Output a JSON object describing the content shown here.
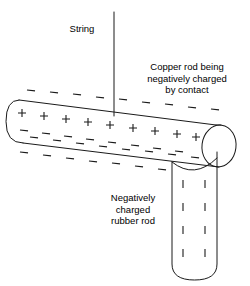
{
  "figure": {
    "background_color": "#ffffff",
    "stroke_color": "#1a1a1a",
    "width": 250,
    "height": 286
  },
  "labels": {
    "string": "String",
    "copper": "Copper rod being\nnegatively charged\nby contact",
    "rubber": "Negatively\ncharged\nrubber rod"
  },
  "elements": {
    "string_line": {
      "name": "string",
      "x": 114,
      "y_top": 12,
      "y_bottom": 116
    },
    "copper_rod": {
      "name": "copper-rod",
      "orientation": "horizontal-tilted",
      "left_x": 10,
      "right_x": 238,
      "tilt": "descending-to-right",
      "interior_charge": "+",
      "exterior_charge": "-",
      "interior_charge_count": 10,
      "exterior_charge_rows": 2
    },
    "rubber_rod": {
      "name": "rubber-rod",
      "orientation": "vertical",
      "left_x": 172,
      "right_x": 217,
      "top_y": 158,
      "bottom_y": 280,
      "charge": "-",
      "charge_columns": 2,
      "charge_rows": 4
    }
  },
  "charges": {
    "copper_plus": [
      [
        22,
        113
      ],
      [
        44,
        116
      ],
      [
        66,
        119
      ],
      [
        88,
        122
      ],
      [
        110,
        125
      ],
      [
        133,
        128
      ],
      [
        155,
        131
      ],
      [
        177,
        134
      ],
      [
        196,
        137
      ],
      [
        214,
        140
      ]
    ],
    "copper_minus_inner": [
      [
        24,
        128
      ],
      [
        46,
        131
      ],
      [
        68,
        134
      ],
      [
        90,
        137
      ],
      [
        112,
        140
      ],
      [
        135,
        143
      ],
      [
        157,
        146
      ],
      [
        179,
        149
      ],
      [
        198,
        152
      ]
    ],
    "copper_minus_above": [
      [
        31,
        92
      ],
      [
        54,
        94
      ],
      [
        77,
        96
      ],
      [
        100,
        98
      ],
      [
        123,
        100
      ],
      [
        146,
        103
      ],
      [
        169,
        105
      ],
      [
        192,
        107
      ],
      [
        215,
        110
      ]
    ],
    "copper_minus_below": [
      [
        22,
        140
      ],
      [
        45,
        143
      ],
      [
        68,
        146
      ],
      [
        91,
        149
      ],
      [
        114,
        152
      ],
      [
        137,
        155
      ],
      [
        160,
        158
      ]
    ],
    "copper_minus_bottom_outer": [
      [
        18,
        150
      ],
      [
        41,
        153
      ],
      [
        64,
        156
      ],
      [
        87,
        159
      ],
      [
        110,
        162
      ],
      [
        133,
        165
      ],
      [
        156,
        168
      ]
    ],
    "rubber_minus": [
      [
        183,
        184
      ],
      [
        205,
        184
      ],
      [
        183,
        207
      ],
      [
        205,
        207
      ],
      [
        183,
        230
      ],
      [
        205,
        230
      ],
      [
        183,
        253
      ],
      [
        205,
        253
      ]
    ]
  }
}
